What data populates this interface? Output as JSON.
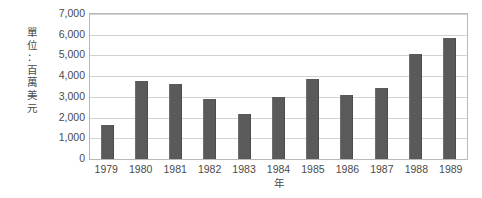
{
  "chart_data": {
    "type": "bar",
    "title": "",
    "subtitle": "",
    "xlabel": "年",
    "ylabel": "單位：百萬美元",
    "ylabel_chars": [
      "單",
      "位",
      "：",
      "百",
      "萬",
      "美",
      "元"
    ],
    "categories": [
      "1979",
      "1980",
      "1981",
      "1982",
      "1983",
      "1984",
      "1985",
      "1986",
      "1987",
      "1988",
      "1989"
    ],
    "values": [
      1650,
      3780,
      3620,
      2900,
      2150,
      3000,
      3850,
      3100,
      3450,
      5050,
      5850
    ],
    "ylim": [
      0,
      7000
    ],
    "ytick_values": [
      0,
      1000,
      2000,
      3000,
      4000,
      5000,
      6000,
      7000
    ],
    "ytick_labels": [
      "0",
      "1,000",
      "2,000",
      "3,000",
      "4,000",
      "5,000",
      "6,000",
      "7,000"
    ],
    "grid": true,
    "grid_axis": "y",
    "legend": false,
    "legend_position": "none",
    "series": [
      {
        "name": "",
        "values": [
          1650,
          3780,
          3620,
          2900,
          2150,
          3000,
          3850,
          3100,
          3450,
          5050,
          5850
        ]
      }
    ]
  },
  "colors": {
    "bar_fill": "#5a5a5a",
    "gridline": "#d2d2d2",
    "plot_border": "#b9b9b9",
    "text": "#4a4a4a",
    "background": "#ffffff"
  }
}
